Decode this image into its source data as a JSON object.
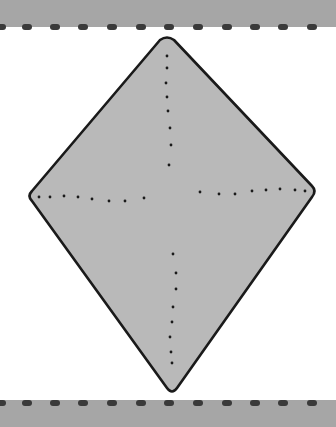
{
  "diagram": {
    "type": "kite-fold-diagram",
    "shape": "diamond",
    "colors": {
      "band": "#a6a6a6",
      "dash": "#3a3a3a",
      "fill": "#b9b9b9",
      "outline": "#1a1a1a",
      "dots": "#1a1a1a",
      "background": "#ffffff"
    },
    "vertices": {
      "top": [
        167,
        37
      ],
      "right": [
        316,
        191
      ],
      "bottom": [
        172,
        393
      ],
      "left": [
        28,
        196
      ]
    },
    "fold_lines": [
      {
        "name": "vertical-upper",
        "style": "dotted"
      },
      {
        "name": "vertical-lower",
        "style": "dotted"
      },
      {
        "name": "horizontal-left",
        "style": "dotted"
      },
      {
        "name": "horizontal-right",
        "style": "dotted"
      }
    ],
    "bands": [
      {
        "position": "top",
        "edge": "dashed"
      },
      {
        "position": "bottom",
        "edge": "dashed"
      }
    ]
  }
}
